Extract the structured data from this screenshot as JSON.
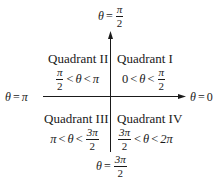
{
  "diagram": {
    "axes": {
      "top_label": {
        "lhs": "θ",
        "eq": "=",
        "num": "π",
        "den": "2"
      },
      "bottom_label": {
        "lhs": "θ",
        "eq": "=",
        "num": "3π",
        "den": "2"
      },
      "left_label": {
        "lhs": "θ",
        "eq": "=",
        "rhs": "π"
      },
      "right_label": {
        "lhs": "θ",
        "eq": "=",
        "rhs": "0"
      }
    },
    "quadrants": [
      {
        "id": "I",
        "title": "Quadrant I",
        "range": {
          "low": "0",
          "lt1": "<",
          "var": "θ",
          "lt2": "<",
          "high_num": "π",
          "high_den": "2"
        }
      },
      {
        "id": "II",
        "title": "Quadrant II",
        "range": {
          "low_num": "π",
          "low_den": "2",
          "lt1": "<",
          "var": "θ",
          "lt2": "<",
          "high": "π"
        }
      },
      {
        "id": "III",
        "title": "Quadrant III",
        "range": {
          "low": "π",
          "lt1": "<",
          "var": "θ",
          "lt2": "<",
          "high_num": "3π",
          "high_den": "2"
        }
      },
      {
        "id": "IV",
        "title": "Quadrant IV",
        "range": {
          "low_num": "3π",
          "low_den": "2",
          "lt1": "<",
          "var": "θ",
          "lt2": "<",
          "high": "2π"
        }
      }
    ],
    "colors": {
      "ink": "#1a1a1a",
      "background": "#ffffff"
    }
  }
}
